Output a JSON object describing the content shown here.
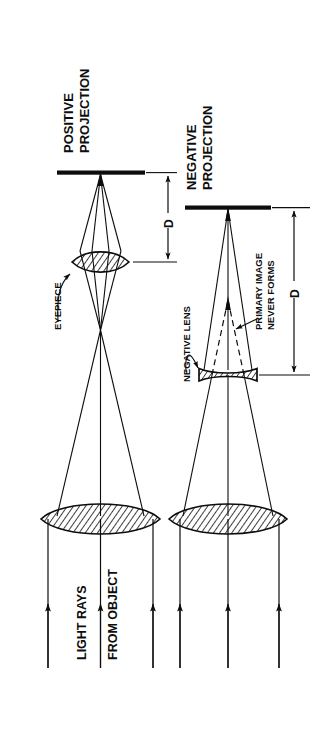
{
  "figure": {
    "title_not_shown": "",
    "background_color": "#ffffff",
    "ink_color": "#0d0d0d",
    "orientation_note": "all text rotated 90 degrees counter-clockwise"
  },
  "panels": [
    {
      "id": "positive",
      "heading_line1": "POSITIVE",
      "heading_line2": "PROJECTION",
      "dimension_label": "D",
      "callouts": [
        {
          "name": "eyepiece",
          "text": "EYEPIECE"
        }
      ],
      "elements": [
        {
          "name": "screen",
          "type": "image-plane-bar"
        },
        {
          "name": "eyepiece-lens",
          "type": "biconvex-lens"
        },
        {
          "name": "primary-image-focus",
          "type": "ray-crossover"
        },
        {
          "name": "objective-lens",
          "type": "biconvex-lens"
        },
        {
          "name": "incoming-rays",
          "type": "parallel-rays",
          "count": 3
        }
      ]
    },
    {
      "id": "negative",
      "heading_line1": "NEGATIVE",
      "heading_line2": "PROJECTION",
      "dimension_label": "D",
      "callouts": [
        {
          "name": "negative-lens",
          "text": "NEGATIVE LENS"
        },
        {
          "name": "primary-image",
          "text_line1": "PRIMARY IMAGE",
          "text_line2": "NEVER FORMS"
        }
      ],
      "elements": [
        {
          "name": "screen",
          "type": "image-plane-bar"
        },
        {
          "name": "negative-lens",
          "type": "biconcave-lens"
        },
        {
          "name": "virtual-image-rays",
          "type": "dashed-rays"
        },
        {
          "name": "objective-lens",
          "type": "biconvex-lens"
        },
        {
          "name": "incoming-rays",
          "type": "parallel-rays",
          "count": 3
        }
      ]
    }
  ],
  "shared_labels": {
    "light_rays": "LIGHT RAYS",
    "from_object": "FROM OBJECT"
  }
}
